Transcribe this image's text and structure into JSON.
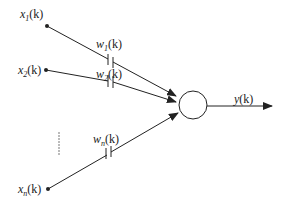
{
  "diagram": {
    "type": "neuron-model",
    "inputs": [
      {
        "id": "x1",
        "base": "x",
        "sub": "1",
        "arg": "(k)",
        "weight": {
          "base": "w",
          "sub": "1",
          "arg": "(k)"
        }
      },
      {
        "id": "x2",
        "base": "x",
        "sub": "2",
        "arg": "(k)",
        "weight": {
          "base": "w",
          "sub": "2",
          "arg": "(k)"
        }
      },
      {
        "id": "xn",
        "base": "x",
        "sub": "n",
        "arg": "(k)",
        "weight": {
          "base": "w",
          "sub": "n",
          "arg": "(k)"
        }
      }
    ],
    "ellipsis": "⋮",
    "node": {
      "shape": "circle"
    },
    "output": {
      "base": "y",
      "arg": "(k)"
    },
    "colors": {
      "stroke": "#222222",
      "background": "#ffffff"
    }
  }
}
